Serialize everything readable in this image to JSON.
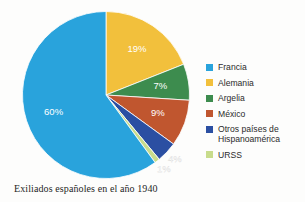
{
  "caption": "Exiliados españoles en el año 1940",
  "legend": {
    "items": [
      {
        "label": "Francia",
        "color": "#29a3dc"
      },
      {
        "label": "Alemania",
        "color": "#f2c03c"
      },
      {
        "label": "Argelia",
        "color": "#3d8c4e"
      },
      {
        "label": "México",
        "color": "#c0562f"
      },
      {
        "label": "Otros países de\nHispanoamérica",
        "color": "#2b4fa2"
      },
      {
        "label": "URSS",
        "color": "#c8dc8c"
      }
    ]
  },
  "chart_data": {
    "type": "pie",
    "title": "Exiliados españoles en el año 1940",
    "xlabel": "",
    "ylabel": "",
    "legend_position": "right",
    "start_angle_deg": 0,
    "direction": "clockwise",
    "categories": [
      "Francia",
      "Alemania",
      "Argelia",
      "México",
      "Otros países de Hispanoamérica",
      "URSS"
    ],
    "values": [
      60,
      19,
      7,
      9,
      4,
      1
    ],
    "unit": "%",
    "data_labels": [
      "60%",
      "19%",
      "7%",
      "9%",
      "4%",
      "1%"
    ],
    "colors": [
      "#29a3dc",
      "#f2c03c",
      "#3d8c4e",
      "#c0562f",
      "#2b4fa2",
      "#c8dc8c"
    ],
    "slice_order_clockwise_from_top": [
      {
        "name": "Alemania",
        "value": 19,
        "label": "19%",
        "color": "#f2c03c"
      },
      {
        "name": "Argelia",
        "value": 7,
        "label": "7%",
        "color": "#3d8c4e"
      },
      {
        "name": "México",
        "value": 9,
        "label": "9%",
        "color": "#c0562f"
      },
      {
        "name": "Otros países de Hispanoamérica",
        "value": 4,
        "label": "4%",
        "color": "#2b4fa2"
      },
      {
        "name": "URSS",
        "value": 1,
        "label": "1%",
        "color": "#c8dc8c"
      },
      {
        "name": "Francia",
        "value": 60,
        "label": "60%",
        "color": "#29a3dc"
      }
    ],
    "labels_outside": [
      "4%",
      "1%"
    ],
    "label_text_color": "#ffffff"
  }
}
